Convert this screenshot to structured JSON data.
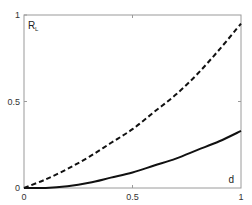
{
  "chart_data": {
    "type": "line",
    "title": "",
    "xlabel": "d",
    "ylabel": "R_L",
    "ylabel_main": "R",
    "ylabel_sub": "L",
    "xlim": [
      0,
      1
    ],
    "ylim": [
      0,
      1
    ],
    "xticks": [
      "0",
      "0.5",
      "1"
    ],
    "yticks": [
      "0",
      "0.5",
      "1"
    ],
    "grid": false,
    "legend": null,
    "x": [
      0,
      0.1,
      0.2,
      0.3,
      0.4,
      0.5,
      0.6,
      0.7,
      0.8,
      0.9,
      1.0
    ],
    "series": [
      {
        "name": "dashed",
        "style": "dashed",
        "color": "#111111",
        "values": [
          0.0,
          0.05,
          0.11,
          0.18,
          0.26,
          0.34,
          0.44,
          0.54,
          0.66,
          0.8,
          0.95
        ]
      },
      {
        "name": "solid",
        "style": "solid",
        "color": "#111111",
        "values": [
          0.0,
          0.0,
          0.01,
          0.03,
          0.06,
          0.09,
          0.13,
          0.17,
          0.22,
          0.27,
          0.33
        ]
      }
    ]
  }
}
